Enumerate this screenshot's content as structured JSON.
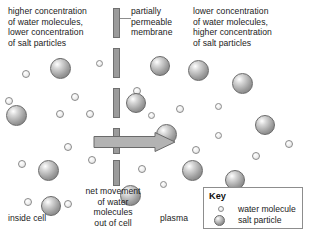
{
  "diagram": {
    "title_text_left": "higher concentration\nof water molecules,\nlower concentration\nof salt particles",
    "title_text_membrane": "partially\npermeable\nmembrane",
    "title_text_right": "lower concentration\nof water molecules,\nhigher concentration\nof salt particles",
    "arrow_label": "net movement\nof water\nmolecules\nout of cell",
    "region_left_label": "inside cell",
    "region_right_label": "plasma"
  },
  "key": {
    "title": "Key",
    "items": [
      {
        "label": "water molecule",
        "icon": "small-circle"
      },
      {
        "label": "salt particle",
        "icon": "large-circle"
      }
    ]
  },
  "colors": {
    "membrane": "#9b9b9b",
    "membrane_border": "#6f6f6f",
    "arrow_fill": "#b3b3b3",
    "arrow_border": "#6a6a6a",
    "water_border": "#8a8a8a",
    "salt_border": "#6a6a6a",
    "text": "#1a1a1a",
    "key_border": "#8d8d8d",
    "background": "#ffffff"
  },
  "membrane_segments": [
    {
      "top": 8,
      "height": 30
    },
    {
      "top": 48,
      "height": 30
    },
    {
      "top": 88,
      "height": 30
    },
    {
      "top": 128,
      "height": 26
    },
    {
      "top": 160,
      "height": 26
    }
  ],
  "particles": {
    "water": [
      {
        "x": 22,
        "y": 70,
        "d": 8
      },
      {
        "x": 56,
        "y": 58,
        "d": 8
      },
      {
        "x": 96,
        "y": 60,
        "d": 7
      },
      {
        "x": 71,
        "y": 93,
        "d": 8
      },
      {
        "x": 5,
        "y": 97,
        "d": 8
      },
      {
        "x": 56,
        "y": 110,
        "d": 8
      },
      {
        "x": 86,
        "y": 110,
        "d": 8
      },
      {
        "x": 64,
        "y": 143,
        "d": 8
      },
      {
        "x": 18,
        "y": 160,
        "d": 8
      },
      {
        "x": 88,
        "y": 156,
        "d": 8
      },
      {
        "x": 24,
        "y": 198,
        "d": 8
      },
      {
        "x": 64,
        "y": 200,
        "d": 8
      },
      {
        "x": 133,
        "y": 87,
        "d": 8
      },
      {
        "x": 176,
        "y": 105,
        "d": 8
      },
      {
        "x": 148,
        "y": 112,
        "d": 7
      },
      {
        "x": 215,
        "y": 103,
        "d": 7
      },
      {
        "x": 215,
        "y": 132,
        "d": 7
      },
      {
        "x": 192,
        "y": 146,
        "d": 8
      },
      {
        "x": 252,
        "y": 152,
        "d": 8
      },
      {
        "x": 138,
        "y": 165,
        "d": 8
      },
      {
        "x": 285,
        "y": 140,
        "d": 8
      },
      {
        "x": 160,
        "y": 181,
        "d": 7
      }
    ],
    "salt": [
      {
        "x": 50,
        "y": 58,
        "d": 21
      },
      {
        "x": 6,
        "y": 105,
        "d": 21
      },
      {
        "x": 38,
        "y": 160,
        "d": 21
      },
      {
        "x": 41,
        "y": 196,
        "d": 20
      },
      {
        "x": 126,
        "y": 93,
        "d": 20
      },
      {
        "x": 150,
        "y": 56,
        "d": 20
      },
      {
        "x": 188,
        "y": 60,
        "d": 21
      },
      {
        "x": 232,
        "y": 73,
        "d": 21
      },
      {
        "x": 156,
        "y": 124,
        "d": 21
      },
      {
        "x": 255,
        "y": 115,
        "d": 20
      },
      {
        "x": 182,
        "y": 160,
        "d": 21
      },
      {
        "x": 225,
        "y": 170,
        "d": 20
      },
      {
        "x": 203,
        "y": 190,
        "d": 14
      },
      {
        "x": 120,
        "y": 185,
        "d": 21
      }
    ]
  }
}
